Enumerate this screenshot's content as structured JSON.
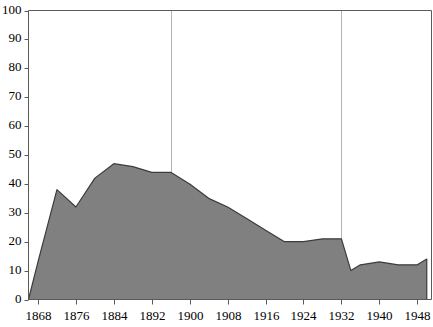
{
  "chart_data": {
    "type": "area",
    "title": "",
    "subtitle": "",
    "xlabel": "",
    "ylabel": "",
    "xlim": [
      1866,
      1951
    ],
    "ylim": [
      0,
      100
    ],
    "grid": "vertical-only",
    "legend": "none",
    "fill_color": "#808080",
    "line_color": "#3c3c3c",
    "axis_color": "#5a5a5a",
    "gridline_color": "#b4b4b4",
    "background_color": "#ffffff",
    "xticks": [
      1868,
      1876,
      1884,
      1892,
      1900,
      1908,
      1916,
      1924,
      1932,
      1940,
      1948
    ],
    "xtick_labels": [
      "1868",
      "1876",
      "1884",
      "1892",
      "1900",
      "1908",
      "1916",
      "1924",
      "1932",
      "1940",
      "1948"
    ],
    "yticks": [
      0,
      10,
      20,
      30,
      40,
      50,
      60,
      70,
      80,
      90,
      100
    ],
    "ytick_labels": [
      "0",
      "10",
      "20",
      "30",
      "40",
      "50",
      "60",
      "70",
      "80",
      "90",
      "100"
    ],
    "vertical_gridlines": [
      1896,
      1932
    ],
    "series": [
      {
        "name": "series-1",
        "x": [
          1866,
          1868,
          1872,
          1876,
          1880,
          1884,
          1888,
          1892,
          1896,
          1900,
          1904,
          1908,
          1912,
          1916,
          1920,
          1924,
          1928,
          1932,
          1934,
          1936,
          1940,
          1944,
          1948,
          1950
        ],
        "values": [
          0,
          13,
          38,
          32,
          42,
          47,
          46,
          44,
          44,
          40,
          35,
          32,
          28,
          24,
          20,
          20,
          21,
          21,
          10,
          12,
          13,
          12,
          12,
          14
        ]
      }
    ]
  }
}
